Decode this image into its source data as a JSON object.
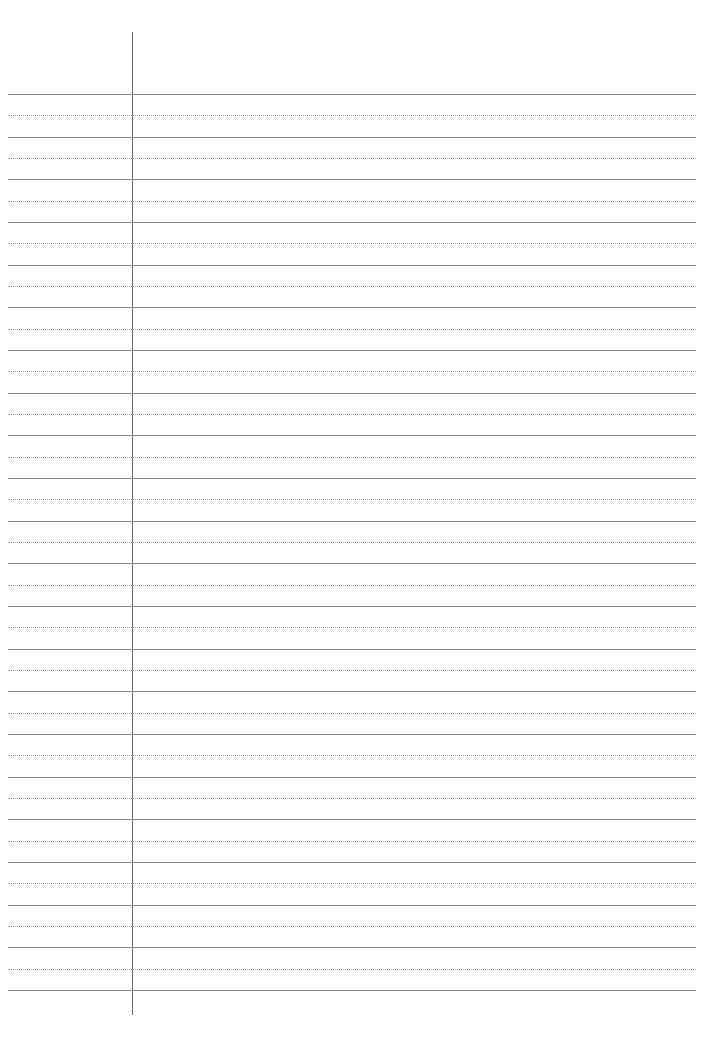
{
  "page": {
    "type": "lined-notebook-paper",
    "background_color": "#ffffff",
    "line_color": "#8a8a8a",
    "dotted_line_color": "#9a9a9a",
    "margin_line_color": "#6a6a6a",
    "margin_x": 132,
    "first_line_y": 94,
    "line_spacing": 42.67,
    "solid_line_count": 22,
    "dotted_line_count": 21
  }
}
